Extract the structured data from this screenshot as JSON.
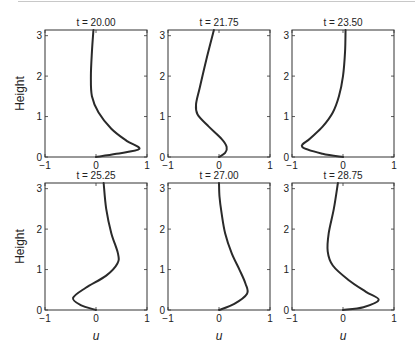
{
  "chart_data": [
    {
      "type": "line",
      "title": "t = 20.00",
      "xlabel": "",
      "ylabel": "Height",
      "xlim": [
        -1,
        1
      ],
      "ylim": [
        0,
        3.14
      ],
      "xticks": [
        "-1",
        "0",
        "1"
      ],
      "yticks": [
        "0",
        "1",
        "2",
        "3"
      ],
      "series": [
        {
          "name": "u",
          "u": [
            0,
            0.4,
            0.85,
            0.6,
            0.3,
            0.05,
            -0.08,
            -0.1,
            -0.08,
            -0.05
          ],
          "height": [
            0,
            0.08,
            0.2,
            0.4,
            0.7,
            1.1,
            1.5,
            2.0,
            2.6,
            3.14
          ]
        }
      ]
    },
    {
      "type": "line",
      "title": "t = 21.75",
      "xlabel": "",
      "ylabel": "",
      "xlim": [
        -1,
        1
      ],
      "ylim": [
        0,
        3.14
      ],
      "xticks": [
        "-1",
        "0",
        "1"
      ],
      "yticks": [
        "0",
        "1",
        "2",
        "3"
      ],
      "series": [
        {
          "name": "u",
          "u": [
            0,
            0.12,
            0.15,
            0.05,
            -0.2,
            -0.42,
            -0.45,
            -0.38,
            -0.25,
            -0.1
          ],
          "height": [
            0,
            0.1,
            0.25,
            0.45,
            0.75,
            1.05,
            1.3,
            1.7,
            2.4,
            3.14
          ]
        }
      ]
    },
    {
      "type": "line",
      "title": "t = 23.50",
      "xlabel": "",
      "ylabel": "",
      "xlim": [
        -1,
        1
      ],
      "ylim": [
        0,
        3.14
      ],
      "xticks": [
        "-1",
        "0",
        "1"
      ],
      "yticks": [
        "0",
        "1",
        "2",
        "3"
      ],
      "series": [
        {
          "name": "u",
          "u": [
            0,
            -0.4,
            -0.8,
            -0.65,
            -0.4,
            -0.2,
            -0.08,
            0.0,
            0.04,
            0.05
          ],
          "height": [
            0,
            0.08,
            0.25,
            0.45,
            0.75,
            1.1,
            1.5,
            2.0,
            2.6,
            3.14
          ]
        }
      ]
    },
    {
      "type": "line",
      "title": "t = 25.25",
      "xlabel": "u",
      "ylabel": "Height",
      "xlim": [
        -1,
        1
      ],
      "ylim": [
        0,
        3.14
      ],
      "xticks": [
        "-1",
        "0",
        "1"
      ],
      "yticks": [
        "0",
        "1",
        "2",
        "3"
      ],
      "series": [
        {
          "name": "u",
          "u": [
            0,
            -0.3,
            -0.45,
            -0.2,
            0.2,
            0.42,
            0.43,
            0.3,
            0.2,
            0.15
          ],
          "height": [
            0,
            0.12,
            0.3,
            0.55,
            0.85,
            1.15,
            1.4,
            1.9,
            2.5,
            3.14
          ]
        }
      ]
    },
    {
      "type": "line",
      "title": "t = 27.00",
      "xlabel": "u",
      "ylabel": "",
      "xlim": [
        -1,
        1
      ],
      "ylim": [
        0,
        3.14
      ],
      "xticks": [
        "-1",
        "0",
        "1"
      ],
      "yticks": [
        "0",
        "1",
        "2",
        "3"
      ],
      "series": [
        {
          "name": "u",
          "u": [
            0,
            0.3,
            0.55,
            0.52,
            0.4,
            0.25,
            0.12,
            0.05,
            0.01,
            0.0
          ],
          "height": [
            0,
            0.15,
            0.4,
            0.65,
            1.0,
            1.4,
            1.9,
            2.4,
            2.8,
            3.14
          ]
        }
      ]
    },
    {
      "type": "line",
      "title": "t = 28.75",
      "xlabel": "u",
      "ylabel": "",
      "xlim": [
        -1,
        1
      ],
      "ylim": [
        0,
        3.14
      ],
      "xticks": [
        "-1",
        "0",
        "1"
      ],
      "yticks": [
        "0",
        "1",
        "2",
        "3"
      ],
      "series": [
        {
          "name": "u",
          "u": [
            0,
            0.4,
            0.7,
            0.45,
            0.1,
            -0.2,
            -0.3,
            -0.28,
            -0.18,
            -0.1
          ],
          "height": [
            0,
            0.07,
            0.25,
            0.45,
            0.75,
            1.1,
            1.45,
            1.9,
            2.5,
            3.14
          ]
        }
      ]
    }
  ]
}
